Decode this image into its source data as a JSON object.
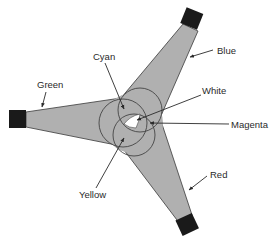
{
  "diagram": {
    "colors": {
      "beam_fill": "#b0b0b0",
      "projector": "#1a1a1a",
      "outline": "#444444",
      "white_region": "#ffffff"
    },
    "projectors": [
      {
        "id": "green",
        "label": "Green"
      },
      {
        "id": "blue",
        "label": "Blue"
      },
      {
        "id": "red",
        "label": "Red"
      }
    ],
    "overlaps": [
      {
        "id": "cyan",
        "label": "Cyan"
      },
      {
        "id": "white",
        "label": "White"
      },
      {
        "id": "magenta",
        "label": "Magenta"
      },
      {
        "id": "yellow",
        "label": "Yellow"
      }
    ]
  }
}
